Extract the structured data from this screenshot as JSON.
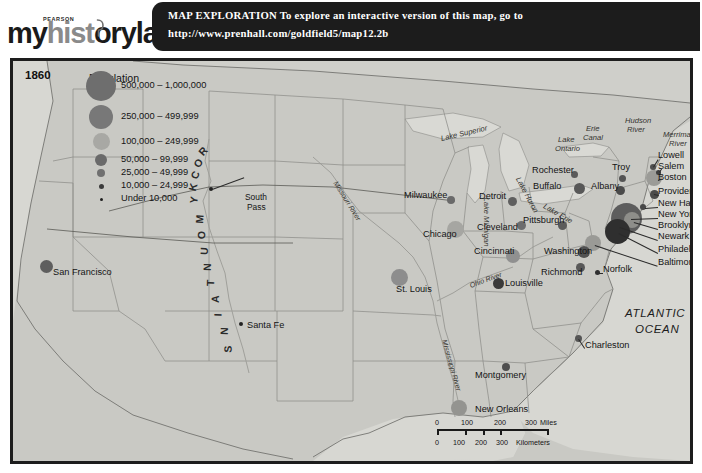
{
  "logo": {
    "brand_small": "PEARSON",
    "word_my": "my",
    "word_hist": "hist",
    "word_o": "o",
    "word_rylab": "rylab",
    "icon": "magnifying-glass-icon"
  },
  "banner": {
    "line1": "MAP EXPLORATION  To explore an interactive version of this map, go to",
    "line2": "http://www.prenhall.com/goldfield5/map12.2b",
    "background": "#1c1c1c",
    "text_color": "#ffffff"
  },
  "map": {
    "year": "1860",
    "ocean_label": "ATLANTIC\nOCEAN",
    "ocean_label_line1": "ATLANTIC",
    "ocean_label_line2": "OCEAN",
    "land_color": "#c9c9c4",
    "water_color": "#d9d9d4",
    "border_color": "#1d1d1d"
  },
  "legend": {
    "title": "Population",
    "items": [
      {
        "label": "500,000 – 1,000,000",
        "diameter": 30,
        "color": "#6e6e6e"
      },
      {
        "label": "250,000 – 499,999",
        "diameter": 24,
        "color": "#787878"
      },
      {
        "label": "100,000 – 249,999",
        "diameter": 17,
        "color": "#a8a8a4"
      },
      {
        "label": "50,000 – 99,999",
        "diameter": 12,
        "color": "#6a6a6a"
      },
      {
        "label": "25,000 – 49,999",
        "diameter": 8,
        "color": "#707070"
      },
      {
        "label": "10,000 – 24,999",
        "diameter": 5,
        "color": "#3b3b3b"
      },
      {
        "label": "Under 10,000",
        "diameter": 3,
        "color": "#1f1f1f"
      }
    ]
  },
  "cities": [
    {
      "name": "San Francisco",
      "x": 33,
      "y": 205,
      "d": 13,
      "color": "#5e5e5e",
      "lx": 40,
      "ly": 212
    },
    {
      "name": "Santa Fe",
      "x": 228,
      "y": 263,
      "d": 4,
      "color": "#222222",
      "lx": 234,
      "ly": 265
    },
    {
      "name": "Milwaukee",
      "x": 438,
      "y": 139,
      "d": 8,
      "color": "#6a6a6a",
      "lx": 391,
      "ly": 135
    },
    {
      "name": "Chicago",
      "x": 442,
      "y": 168,
      "d": 17,
      "color": "#a6a6a2",
      "lx": 410,
      "ly": 174
    },
    {
      "name": "Detroit",
      "x": 499,
      "y": 140,
      "d": 9,
      "color": "#5f5f5f",
      "lx": 466,
      "ly": 136
    },
    {
      "name": "Cleveland",
      "x": 508,
      "y": 164,
      "d": 9,
      "color": "#6d6d6d",
      "lx": 464,
      "ly": 167
    },
    {
      "name": "Cincinnati",
      "x": 500,
      "y": 195,
      "d": 14,
      "color": "#909090",
      "lx": 461,
      "ly": 191
    },
    {
      "name": "St. Louis",
      "x": 386,
      "y": 216,
      "d": 17,
      "color": "#8d8d8d",
      "lx": 383,
      "ly": 229
    },
    {
      "name": "Louisville",
      "x": 485,
      "y": 222,
      "d": 11,
      "color": "#3a3a3a",
      "lx": 492,
      "ly": 223
    },
    {
      "name": "Buffalo",
      "x": 566,
      "y": 127,
      "d": 11,
      "color": "#585858",
      "lx": 520,
      "ly": 126
    },
    {
      "name": "Rochester",
      "x": 561,
      "y": 113,
      "d": 7,
      "color": "#5a5a5a",
      "lx": 519,
      "ly": 110
    },
    {
      "name": "Troy",
      "x": 609,
      "y": 117,
      "d": 7,
      "color": "#545454",
      "lx": 599,
      "ly": 107
    },
    {
      "name": "Albany",
      "x": 607,
      "y": 129,
      "d": 9,
      "color": "#4a4a4a",
      "lx": 578,
      "ly": 126
    },
    {
      "name": "Boston",
      "x": 641,
      "y": 117,
      "d": 16,
      "color": "#9b9b97",
      "lx": 645,
      "ly": 117
    },
    {
      "name": "Lowell",
      "x": 640,
      "y": 106,
      "d": 6,
      "color": "#4f4f4f",
      "lx": 645,
      "ly": 95
    },
    {
      "name": "Salem",
      "x": 645,
      "y": 111,
      "d": 5,
      "color": "#3d3d3d",
      "lx": 645,
      "ly": 106
    },
    {
      "name": "Providence",
      "x": 641,
      "y": 133,
      "d": 9,
      "color": "#4b4b4b",
      "lx": 645,
      "ly": 131
    },
    {
      "name": "New Haven",
      "x": 630,
      "y": 146,
      "d": 6,
      "color": "#494949",
      "lx": 645,
      "ly": 143
    },
    {
      "name": "New York",
      "x": 613,
      "y": 157,
      "d": 31,
      "color": "#5d5d5d",
      "lx": 645,
      "ly": 154
    },
    {
      "name": "Brooklyn",
      "x": 619,
      "y": 159,
      "d": 16,
      "color": "#8e8e8a",
      "lx": 645,
      "ly": 165
    },
    {
      "name": "Newark",
      "x": 605,
      "y": 164,
      "d": 9,
      "color": "#4c4c4c",
      "lx": 645,
      "ly": 176
    },
    {
      "name": "Philadelphia",
      "x": 604,
      "y": 170,
      "d": 25,
      "color": "#2f2f2f",
      "lx": 645,
      "ly": 189
    },
    {
      "name": "Baltimore",
      "x": 580,
      "y": 182,
      "d": 16,
      "color": "#9a9a96",
      "lx": 645,
      "ly": 202
    },
    {
      "name": "Pittsburgh",
      "x": 549,
      "y": 164,
      "d": 9,
      "color": "#5b5b5b",
      "lx": 510,
      "ly": 160
    },
    {
      "name": "Washington",
      "x": 571,
      "y": 191,
      "d": 12,
      "color": "#525252",
      "lx": 531,
      "ly": 191
    },
    {
      "name": "Richmond",
      "x": 567,
      "y": 206,
      "d": 9,
      "color": "#585858",
      "lx": 528,
      "ly": 212
    },
    {
      "name": "Norfolk",
      "x": 584,
      "y": 211,
      "d": 5,
      "color": "#2f2f2f",
      "lx": 590,
      "ly": 209
    },
    {
      "name": "Charleston",
      "x": 565,
      "y": 277,
      "d": 7,
      "color": "#555555",
      "lx": 572,
      "ly": 285
    },
    {
      "name": "Montgomery",
      "x": 493,
      "y": 306,
      "d": 8,
      "color": "#4e4e4e",
      "lx": 462,
      "ly": 315
    },
    {
      "name": "New Orleans",
      "x": 446,
      "y": 347,
      "d": 16,
      "color": "#949490",
      "lx": 462,
      "ly": 349
    }
  ],
  "features": {
    "waters": [
      {
        "label": "Lake Superior",
        "x": 428,
        "y": 73,
        "rot": -13
      },
      {
        "label": "Lake Michigan",
        "x": 473,
        "y": 132,
        "rot": 90
      },
      {
        "label": "Lake Huron",
        "x": 505,
        "y": 112,
        "rot": 62
      },
      {
        "label": "Lake Erie",
        "x": 531,
        "y": 140,
        "rot": 30
      },
      {
        "label": "Lake",
        "x": 545,
        "y": 74,
        "rot": 0
      },
      {
        "label": "Ontario",
        "x": 542,
        "y": 83,
        "rot": 0
      },
      {
        "label": "Erie",
        "x": 573,
        "y": 63,
        "rot": 0
      },
      {
        "label": "Canal",
        "x": 570,
        "y": 72,
        "rot": 0
      },
      {
        "label": "Hudson",
        "x": 612,
        "y": 55,
        "rot": 0
      },
      {
        "label": "River",
        "x": 614,
        "y": 64,
        "rot": 0
      },
      {
        "label": "Merrimack",
        "x": 650,
        "y": 69,
        "rot": 0
      },
      {
        "label": "River",
        "x": 656,
        "y": 78,
        "rot": 0
      }
    ],
    "rivers": [
      {
        "label": "Missouri River",
        "x": 322,
        "y": 117,
        "rot": 58
      },
      {
        "label": "Mississippi River",
        "x": 431,
        "y": 275,
        "rot": 74
      },
      {
        "label": "Ohio River",
        "x": 457,
        "y": 221,
        "rot": -20
      }
    ],
    "places": [
      {
        "label": "South",
        "x": 232,
        "y": 131
      },
      {
        "label": "Pass",
        "x": 234,
        "y": 141
      }
    ],
    "rocky_mountains": {
      "letters": [
        "R",
        "O",
        "C",
        "K",
        "Y",
        "M",
        "O",
        "U",
        "N",
        "T",
        "A",
        "I",
        "N",
        "S"
      ],
      "text": "ROCKY MOUNTAINS"
    }
  },
  "scale": {
    "miles_ticks": [
      "0",
      "100",
      "200",
      "300"
    ],
    "miles_unit": "Miles",
    "km_ticks": [
      "0",
      "100",
      "200",
      "300"
    ],
    "km_unit": "Kilometers",
    "miles_label": "0      100     200      300 Miles",
    "km_label": "0   100  200  300 Kilometers"
  }
}
